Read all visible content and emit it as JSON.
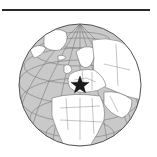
{
  "map": {
    "type": "orthographic-locator-globe",
    "region_centered": "Europe",
    "marker": {
      "symbol": "star",
      "label": "Location marker",
      "color": "#1a1a1a"
    },
    "colors": {
      "ocean": "#c9c9c9",
      "land": "#ffffff",
      "borders": "#6e6e6e",
      "graticule": "#7a7a7a",
      "outline": "#555555",
      "top_rule": "#2a2a2a"
    },
    "visible_regions": [
      "Arctic Ocean",
      "Greenland",
      "Europe",
      "North Africa",
      "Middle East",
      "Russia",
      "Atlantic Ocean",
      "Africa"
    ]
  }
}
